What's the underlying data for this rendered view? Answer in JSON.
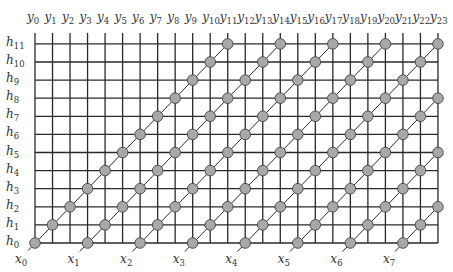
{
  "diagram": {
    "type": "systolic-array-grid",
    "columns": 24,
    "rows": 12,
    "column_labels": [
      "y0",
      "y1",
      "y2",
      "y3",
      "y4",
      "y5",
      "y6",
      "y7",
      "y8",
      "y9",
      "y10",
      "y11",
      "y12",
      "y13",
      "y14",
      "y15",
      "y16",
      "y17",
      "y18",
      "y19",
      "y20",
      "y21",
      "y22",
      "y23"
    ],
    "row_labels": [
      "h0",
      "h1",
      "h2",
      "h3",
      "h4",
      "h5",
      "h6",
      "h7",
      "h8",
      "h9",
      "h10",
      "h11"
    ],
    "input_labels": [
      "x0",
      "x1",
      "x2",
      "x3",
      "x4",
      "x5",
      "x6",
      "x7"
    ],
    "input_start_columns": [
      0,
      3,
      6,
      9,
      12,
      15,
      18,
      21
    ],
    "colors": {
      "grid_line": "#2a2a2a",
      "node_fill": "#a8a8a8",
      "node_stroke": "#444444",
      "label": "#333333"
    }
  }
}
